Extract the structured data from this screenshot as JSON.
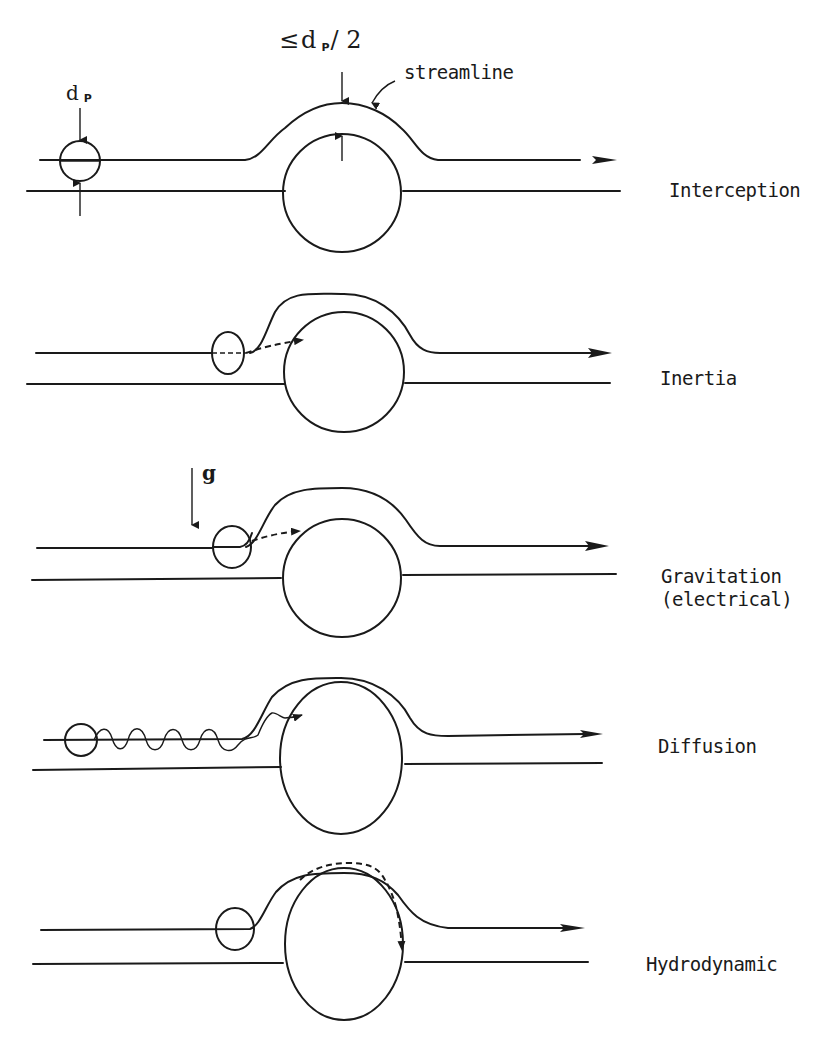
{
  "figure": {
    "annotations": {
      "particle_diameter": "d",
      "particle_diameter_sub": "P",
      "interception_distance_prefix": "≤",
      "interception_distance_d": "d",
      "interception_distance_sub": "P",
      "interception_distance_suffix": "/ 2",
      "streamline": "streamline",
      "gravity": "g"
    },
    "panels": [
      {
        "id": "interception",
        "label": "Interception"
      },
      {
        "id": "inertia",
        "label": "Inertia"
      },
      {
        "id": "gravitation",
        "label": "Gravitation\n(electrical)"
      },
      {
        "id": "diffusion",
        "label": "Diffusion"
      },
      {
        "id": "hydrodynamic",
        "label": "Hydrodynamic"
      }
    ]
  }
}
